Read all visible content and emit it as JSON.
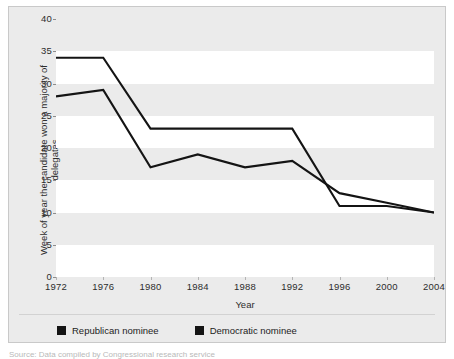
{
  "chart_data": {
    "type": "line",
    "title": "",
    "xlabel": "Year",
    "ylabel": "Week of year the candidate won a majority of delegates",
    "categories": [
      "1972",
      "1976",
      "1980",
      "1984",
      "1988",
      "1992",
      "1996",
      "2000",
      "2004"
    ],
    "x": [
      1972,
      1976,
      1980,
      1984,
      1988,
      1992,
      1996,
      2000,
      2004
    ],
    "xlim": [
      1972,
      2004
    ],
    "ylim": [
      0,
      40
    ],
    "yticks": [
      "0",
      "5",
      "10",
      "15",
      "20",
      "25",
      "30",
      "35",
      "40"
    ],
    "ytick_values": [
      0,
      5,
      10,
      15,
      20,
      25,
      30,
      35,
      40
    ],
    "grid": "horizontal-bands",
    "legend_position": "bottom-left",
    "series": [
      {
        "name": "Republican nominee",
        "color": "#141414",
        "values": [
          34,
          34,
          23,
          23,
          23,
          23,
          11,
          11,
          10
        ]
      },
      {
        "name": "Democratic nominee",
        "color": "#141414",
        "values": [
          28,
          29,
          17,
          19,
          17,
          18,
          13,
          11.5,
          10
        ]
      }
    ]
  },
  "legend": {
    "items": [
      {
        "label": "Republican nominee",
        "color": "#141414"
      },
      {
        "label": "Democratic nominee",
        "color": "#141414"
      }
    ]
  },
  "figure": {
    "background": "#ebebeb",
    "band_color": "#ffffff",
    "border_color": "#c9c9c9"
  },
  "caption": {
    "text": "Source: Data compiled by Congressional research service"
  }
}
